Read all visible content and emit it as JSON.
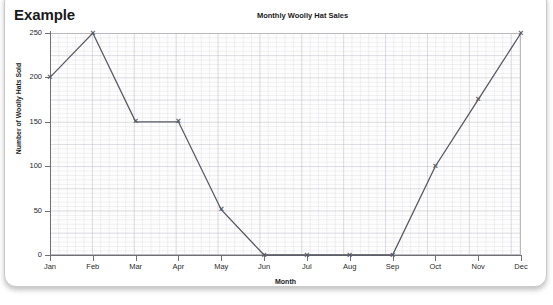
{
  "card": {
    "example_label": "Example"
  },
  "chart_data": {
    "type": "line",
    "title": "Monthly Woolly Hat Sales",
    "xlabel": "Month",
    "ylabel": "Number of Woolly Hats Sold",
    "categories": [
      "Jan",
      "Feb",
      "Mar",
      "Apr",
      "May",
      "Jun",
      "Jul",
      "Aug",
      "Sep",
      "Oct",
      "Nov",
      "Dec"
    ],
    "values": [
      200,
      250,
      150,
      150,
      51,
      0,
      0,
      0,
      0,
      100,
      175,
      250
    ],
    "ylim": [
      0,
      250
    ],
    "yticks": [
      0,
      50,
      100,
      150,
      200,
      250
    ],
    "ytick_labels": [
      "0",
      "50",
      "100",
      "150",
      "200",
      "250"
    ],
    "grid": true,
    "legend": false,
    "marker": "x",
    "line_color": "#595964",
    "grid_color": "#9696a5",
    "series": [
      {
        "name": "Woolly Hats Sold",
        "values": [
          200,
          250,
          150,
          150,
          51,
          0,
          0,
          0,
          0,
          100,
          175,
          250
        ]
      }
    ]
  }
}
